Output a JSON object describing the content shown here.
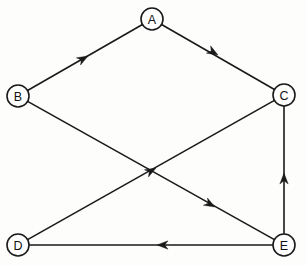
{
  "figure": {
    "kind": "directed-graph",
    "background_color": "#fdfdfc",
    "line_color": "#1a1a1a",
    "node_fill_color": "#ffffff",
    "node_radius": 11,
    "width": 307,
    "height": 266
  },
  "nodes": [
    {
      "id": "A",
      "label": "A",
      "x": 152,
      "y": 19
    },
    {
      "id": "B",
      "label": "B",
      "x": 18,
      "y": 96
    },
    {
      "id": "C",
      "label": "C",
      "x": 284,
      "y": 95
    },
    {
      "id": "D",
      "label": "D",
      "x": 18,
      "y": 245
    },
    {
      "id": "E",
      "label": "E",
      "x": 284,
      "y": 245
    }
  ],
  "edges": [
    {
      "id": "B-A",
      "from": "B",
      "to": "A",
      "directed": true,
      "arrow_at": {
        "x": 88,
        "y": 56
      }
    },
    {
      "id": "A-C",
      "from": "A",
      "to": "C",
      "directed": true,
      "arrow_at": {
        "x": 218,
        "y": 55
      }
    },
    {
      "id": "D-C",
      "from": "D",
      "to": "C",
      "directed": true,
      "arrow_at": {
        "x": 156,
        "y": 168
      }
    },
    {
      "id": "B-E",
      "from": "B",
      "to": "E",
      "directed": true,
      "arrow_at": {
        "x": 215,
        "y": 207
      }
    },
    {
      "id": "E-C",
      "from": "E",
      "to": "C",
      "directed": true,
      "arrow_at": {
        "x": 284,
        "y": 173
      }
    },
    {
      "id": "E-D",
      "from": "E",
      "to": "D",
      "directed": true,
      "arrow_at": {
        "x": 157,
        "y": 245
      }
    }
  ]
}
